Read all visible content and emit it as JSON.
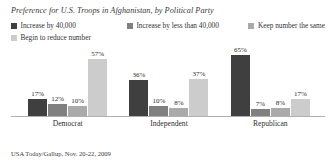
{
  "chart_data": {
    "type": "bar",
    "title": "Preference for U.S. Troops in Afghanistan, by Political Party",
    "xlabel": "",
    "ylabel": "",
    "ylim": [
      0,
      70
    ],
    "grid": false,
    "legend_position": "top",
    "value_suffix": "%",
    "categories": [
      "Democrat",
      "Independent",
      "Republican"
    ],
    "series": [
      {
        "name": "Increase by 40,000",
        "color": "#3f3f3f",
        "values": [
          17,
          36,
          65
        ],
        "labels": [
          "17%",
          "36%",
          "65%"
        ]
      },
      {
        "name": "Increase by less than 40,000",
        "color": "#808080",
        "values": [
          12,
          10,
          7
        ],
        "labels": [
          "12%",
          "10%",
          "7%"
        ]
      },
      {
        "name": "Keep number the same",
        "color": "#aaaaaa",
        "values": [
          10,
          8,
          8
        ],
        "labels": [
          "10%",
          "8%",
          "8%"
        ]
      },
      {
        "name": "Begin to reduce number",
        "color": "#cccccc",
        "values": [
          57,
          37,
          17
        ],
        "labels": [
          "57%",
          "37%",
          "17%"
        ]
      }
    ],
    "source": "USA Today/Gallup, Nov. 20-22, 2009"
  }
}
